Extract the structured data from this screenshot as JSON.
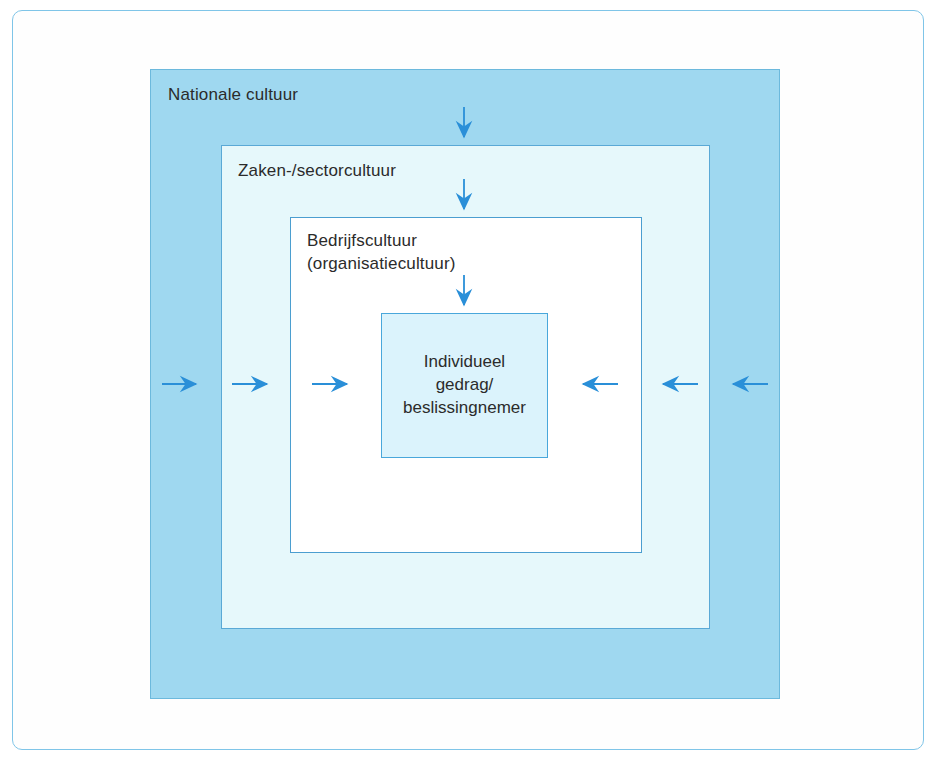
{
  "diagram": {
    "type": "nested-boxes",
    "colors": {
      "national_fill": "#9fd8f0",
      "sector_fill": "#e6f8fb",
      "company_fill": "#ffffff",
      "individual_fill": "#dbf3fc",
      "border": "#5aa9d6",
      "arrow": "#2a8fd8",
      "text": "#2b2b2b",
      "frame": "#7fc5e8"
    },
    "levels": [
      {
        "id": "national",
        "label": "Nationale cultuur",
        "label_position": "top-left",
        "depth": 1
      },
      {
        "id": "sector",
        "label": "Zaken-/sectorcultuur",
        "label_position": "top-left",
        "depth": 2
      },
      {
        "id": "company",
        "label": "Bedrijfscultuur\n(organisatiecultuur)",
        "label_position": "top-left",
        "depth": 3
      },
      {
        "id": "individual",
        "label": "Individueel\ngedrag/\nbeslissingnemer",
        "label_position": "center",
        "depth": 4
      }
    ],
    "arrows": {
      "vertical_count": 3,
      "left_count": 3,
      "right_count": 3,
      "direction": "inward",
      "description": "Pijlen wijzen van buiten naar binnen, naar het individuele gedrag toe"
    }
  }
}
